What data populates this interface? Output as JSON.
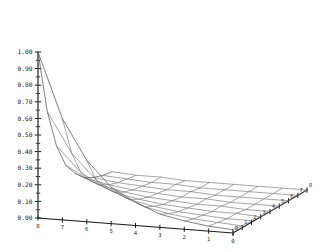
{
  "chart_data": {
    "type": "line",
    "render": "3d-wireframe-surface",
    "title": "",
    "subtitle": "",
    "xlabel": "",
    "ylabel": "",
    "zlabel": "",
    "grid": true,
    "legend": null,
    "background": "#ffffff",
    "line_color": "#6e6e6e",
    "axis_color": "#1a1a1a",
    "text_color": "#1a1a1a",
    "projection": {
      "origin_px": [
        38,
        218
      ],
      "x_far_px": [
        38,
        218
      ],
      "front_corner_px": [
        233,
        233
      ],
      "right_corner_px": [
        307,
        190
      ],
      "apex_px": [
        122,
        10
      ],
      "z_top_px": [
        38,
        52
      ]
    },
    "x": {
      "label": "",
      "range": [
        0,
        8
      ],
      "tick_labels": [
        "8",
        "7",
        "6",
        "5",
        "4",
        "3",
        "2",
        "1",
        "0"
      ],
      "tick_values": [
        8,
        7,
        6,
        5,
        4,
        3,
        2,
        1,
        0
      ],
      "direction": "right-to-left"
    },
    "y": {
      "label": "",
      "range": [
        0,
        8
      ],
      "tick_labels": [
        "0",
        "1",
        "2",
        "3",
        "4",
        "5",
        "6",
        "7",
        "8"
      ],
      "tick_values": [
        0,
        1,
        2,
        3,
        4,
        5,
        6,
        7,
        8
      ],
      "direction": "front-to-back-right"
    },
    "z": {
      "label": "",
      "range": [
        0.0,
        1.0
      ],
      "tick_labels": [
        "1.00",
        "0.90",
        "0.80",
        "0.70",
        "0.60",
        "0.50",
        "0.40",
        "0.30",
        "0.20",
        "0.10",
        "0.00"
      ],
      "tick_values": [
        1.0,
        0.9,
        0.8,
        0.7,
        0.6,
        0.5,
        0.4,
        0.3,
        0.2,
        0.1,
        0.0
      ],
      "minor_ticks_per_interval": 1
    },
    "surface": {
      "function_form": "exponential-decay-peak",
      "nx": 9,
      "ny": 9,
      "peak_value": 1.0,
      "peak_at": [
        8,
        8
      ],
      "z_values": [
        [
          1.0,
          0.61,
          0.37,
          0.22,
          0.14,
          0.08,
          0.05,
          0.03,
          0.02
        ],
        [
          0.61,
          0.37,
          0.22,
          0.14,
          0.08,
          0.05,
          0.03,
          0.02,
          0.01
        ],
        [
          0.37,
          0.22,
          0.14,
          0.08,
          0.05,
          0.03,
          0.02,
          0.01,
          0.01
        ],
        [
          0.22,
          0.14,
          0.08,
          0.05,
          0.03,
          0.02,
          0.01,
          0.01,
          0.0
        ],
        [
          0.14,
          0.08,
          0.05,
          0.03,
          0.02,
          0.01,
          0.01,
          0.0,
          0.0
        ],
        [
          0.08,
          0.05,
          0.03,
          0.02,
          0.01,
          0.01,
          0.0,
          0.0,
          0.0
        ],
        [
          0.05,
          0.03,
          0.02,
          0.01,
          0.01,
          0.0,
          0.0,
          0.0,
          0.0
        ],
        [
          0.03,
          0.02,
          0.01,
          0.01,
          0.0,
          0.0,
          0.0,
          0.0,
          0.0
        ],
        [
          0.02,
          0.01,
          0.01,
          0.0,
          0.0,
          0.0,
          0.0,
          0.0,
          0.0
        ]
      ]
    }
  }
}
